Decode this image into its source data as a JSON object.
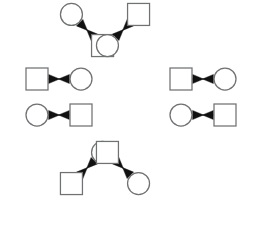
{
  "canvas": {
    "width": 262,
    "height": 244,
    "background": "#ffffff",
    "title": "Radial node-pair diagram"
  },
  "style": {
    "node_stroke": "#6f7173",
    "node_fill": "#ffffff",
    "edge_stroke": "#7a7c7e",
    "arrow_fill": "#111111",
    "node_stroke_width": 1.25,
    "edge_stroke_width": 1.1
  },
  "layout": {
    "center_x": 131,
    "center_y": 109,
    "ring_radius": 78,
    "pair_count": 8,
    "description": "Eight square-circle node pairs arranged radially around a common center; each pair joined by a converging double arrowhead connector."
  },
  "geometry": {
    "square_size": 22,
    "circle_radius": 11,
    "pair_gap": 44
  },
  "pairs": [
    {
      "id": "pair-1",
      "angle_deg": 202.5,
      "cx": 59,
      "cy": 79,
      "rotation_deg": 0,
      "source": {
        "shape": "square",
        "label": ""
      },
      "target": {
        "shape": "circle",
        "label": ""
      },
      "connector": "double-arrow-converging"
    },
    {
      "id": "pair-2",
      "angle_deg": 157.5,
      "cx": 59,
      "cy": 115,
      "rotation_deg": 0,
      "source": {
        "shape": "circle",
        "label": ""
      },
      "target": {
        "shape": "square",
        "label": ""
      },
      "connector": "double-arrow-converging"
    },
    {
      "id": "pair-3",
      "angle_deg": 247.5,
      "cx": 87,
      "cy": 30,
      "rotation_deg": 45,
      "source": {
        "shape": "circle",
        "label": ""
      },
      "target": {
        "shape": "square",
        "label": ""
      },
      "connector": "double-arrow-converging"
    },
    {
      "id": "pair-4",
      "angle_deg": 292.5,
      "cx": 123,
      "cy": 30,
      "rotation_deg": 135,
      "source": {
        "shape": "square",
        "label": ""
      },
      "target": {
        "shape": "circle",
        "label": ""
      },
      "connector": "double-arrow-converging"
    },
    {
      "id": "pair-5",
      "angle_deg": 337.5,
      "cx": 203,
      "cy": 79,
      "rotation_deg": 0,
      "source": {
        "shape": "square",
        "label": ""
      },
      "target": {
        "shape": "circle",
        "label": ""
      },
      "connector": "double-arrow-converging"
    },
    {
      "id": "pair-6",
      "angle_deg": 22.5,
      "cx": 203,
      "cy": 115,
      "rotation_deg": 0,
      "source": {
        "shape": "circle",
        "label": ""
      },
      "target": {
        "shape": "square",
        "label": ""
      },
      "connector": "double-arrow-converging"
    },
    {
      "id": "pair-7",
      "angle_deg": 112.5,
      "cx": 87,
      "cy": 168,
      "rotation_deg": 135,
      "source": {
        "shape": "circle",
        "label": ""
      },
      "target": {
        "shape": "square",
        "label": ""
      },
      "connector": "double-arrow-converging"
    },
    {
      "id": "pair-8",
      "angle_deg": 67.5,
      "cx": 123,
      "cy": 168,
      "rotation_deg": 45,
      "source": {
        "shape": "square",
        "label": ""
      },
      "target": {
        "shape": "circle",
        "label": ""
      },
      "connector": "double-arrow-converging"
    }
  ]
}
